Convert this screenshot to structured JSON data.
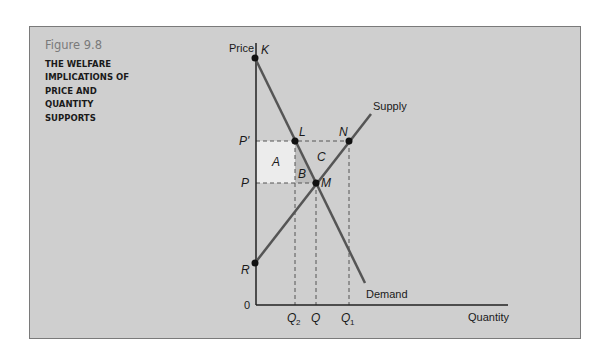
{
  "figure": {
    "number": "Figure 9.8",
    "title_lines": [
      "THE WELFARE",
      "IMPLICATIONS OF",
      "PRICE AND",
      "QUANTITY",
      "SUPPORTS"
    ]
  },
  "axes": {
    "y_label": "Price",
    "x_label": "Quantity",
    "origin_label": "0"
  },
  "price_labels": {
    "p_prime": "P'",
    "p": "P"
  },
  "quantity_labels": {
    "q2": "Q",
    "q2_sub": "2",
    "q": "Q",
    "q1": "Q",
    "q1_sub": "1"
  },
  "curves": {
    "supply": "Supply",
    "demand": "Demand"
  },
  "points": {
    "k": "K",
    "l": "L",
    "n": "N",
    "m": "M",
    "r": "R"
  },
  "areas": {
    "a": "A",
    "b": "B",
    "c": "C"
  },
  "colors": {
    "panel_bg": "#cfcfcf",
    "area_a": "#ececec",
    "area_b": "#bdbdbd",
    "line": "#555555",
    "axis": "#222222"
  }
}
